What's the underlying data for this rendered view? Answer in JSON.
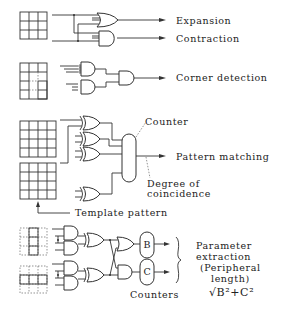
{
  "diagram": {
    "rows": [
      {
        "id": "expansion-contraction",
        "outputs": [
          "Expansion",
          "Contraction"
        ]
      },
      {
        "id": "corner-detection",
        "outputs": [
          "Corner detection"
        ]
      },
      {
        "id": "pattern-matching",
        "outputs": [
          "Pattern matching"
        ],
        "annotations": {
          "counter": "Counter",
          "degree_line1": "Degree of",
          "degree_line2": "coincidence",
          "template": "Template pattern"
        }
      },
      {
        "id": "parameter-extraction",
        "counters": [
          "B",
          "C"
        ],
        "counters_label": "Counters",
        "output_lines": [
          "Parameter",
          "extraction",
          "(Peripheral",
          "length)"
        ],
        "formula": "√B²+C²"
      }
    ]
  }
}
